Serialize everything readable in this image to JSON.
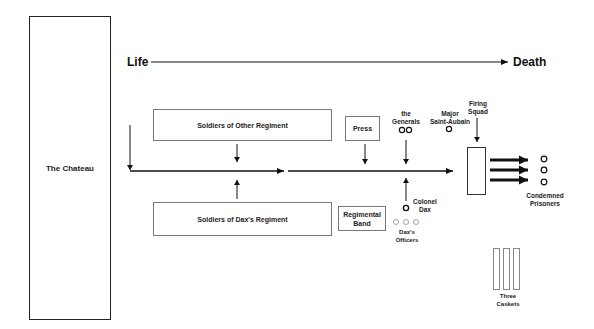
{
  "diagram": {
    "axis": {
      "start_label": "Life",
      "end_label": "Death"
    },
    "chateau": {
      "label": "The Chateau"
    },
    "boxes": {
      "other_regiment": "Soldiers of Other Regiment",
      "dax_regiment": "Soldiers of Dax's Regiment",
      "press": "Press",
      "regimental_band_line1": "Regimental",
      "regimental_band_line2": "Band"
    },
    "people": {
      "generals_line1": "the",
      "generals_line2": "Generals",
      "major_line1": "Major",
      "major_line2": "Saint-Aubain",
      "firing_squad_line1": "Firing",
      "firing_squad_line2": "Squad",
      "colonel_line1": "Colonel",
      "colonel_line2": "Dax",
      "officers_line1": "Dax's",
      "officers_line2": "Officers",
      "prisoners_line1": "Condemned",
      "prisoners_line2": "Prisoners",
      "caskets_line1": "Three",
      "caskets_line2": "Caskets"
    },
    "colors": {
      "line": "#111111",
      "box_border": "#777777",
      "officer_circle": "#999999"
    }
  }
}
